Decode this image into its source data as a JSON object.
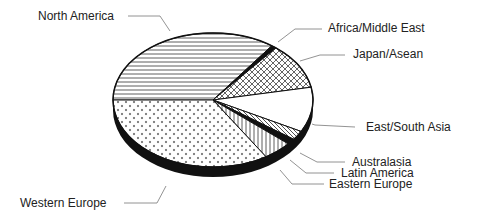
{
  "chart_data": {
    "type": "pie",
    "style": "3d-tilted, black and white hatch patterns",
    "title": "",
    "center": [
      213,
      100
    ],
    "radii": [
      100,
      67
    ],
    "depth": 10,
    "slices": [
      {
        "label": "North America",
        "value": 35,
        "start_deg": 54,
        "end_deg": 180,
        "pattern": "horizontal-lines"
      },
      {
        "label": "Africa/Middle East",
        "value": 1,
        "start_deg": 51,
        "end_deg": 54,
        "pattern": "solid-black"
      },
      {
        "label": "Japan/Asean",
        "value": 11,
        "start_deg": 11,
        "end_deg": 51,
        "pattern": "crosshatch"
      },
      {
        "label": "East/South Asia",
        "value": 11,
        "start_deg": -28,
        "end_deg": 11,
        "pattern": "white"
      },
      {
        "label": "Australasia",
        "value": 2,
        "start_deg": -36,
        "end_deg": -28,
        "pattern": "diagonal-lines"
      },
      {
        "label": "Latin America",
        "value": 1.5,
        "start_deg": -41,
        "end_deg": -36,
        "pattern": "solid-black"
      },
      {
        "label": "Eastern Europe",
        "value": 3,
        "start_deg": -58,
        "end_deg": -41,
        "pattern": "vertical-lines"
      },
      {
        "label": "Western Europe",
        "value": 34,
        "start_deg": -180,
        "end_deg": -58,
        "pattern": "dots"
      }
    ],
    "legend": "none (callout labels with leader lines)"
  },
  "labels": {
    "north_america": "North America",
    "africa_middle_east": "Africa/Middle East",
    "japan_asean": "Japan/Asean",
    "east_south_asia": "East/South Asia",
    "australasia": "Australasia",
    "latin_america": "Latin America",
    "eastern_europe": "Eastern Europe",
    "western_europe": "Western Europe"
  }
}
